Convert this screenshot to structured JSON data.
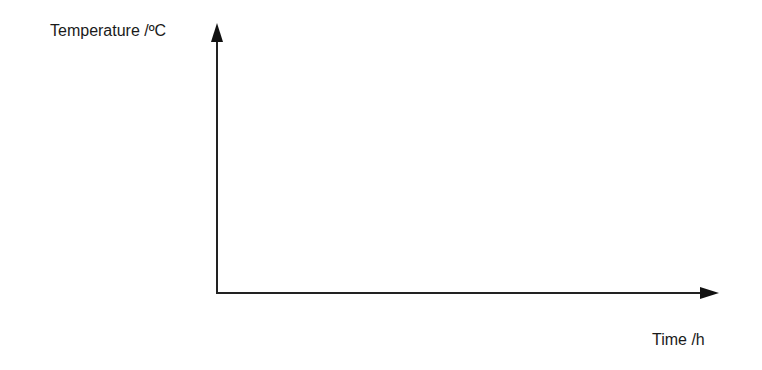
{
  "diagram": {
    "type": "blank-axes",
    "y_axis_label": "Temperature /ºC",
    "x_axis_label": "Time /h",
    "line_color": "#222222"
  }
}
